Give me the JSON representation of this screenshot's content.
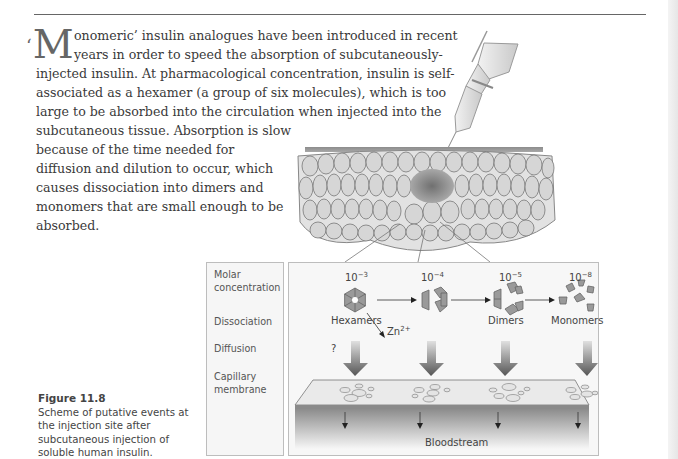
{
  "page": {
    "paragraph": {
      "dropcap_quote": "‘",
      "dropcap_letter": "M",
      "lines": [
        "onomeric’ insulin analogues have been introduced in recent",
        "years in order to speed the absorption of subcutaneously-",
        "injected insulin. At pharmacological concentration, insulin is self-",
        "associated as a hexamer (a group of six molecules), which is too",
        "large to be absorbed into the circulation when injected into the",
        "subcutaneous tissue. Absorption is slow",
        "because of the time needed for",
        "diffusion and dilution to occur, which",
        "causes dissociation into dimers and",
        "monomers that are small enough to be",
        "absorbed."
      ]
    },
    "figure": {
      "number": "Figure 11.8",
      "caption": "Scheme of putative events at the injection site after subcutaneous injection of soluble human insulin.",
      "caption_lines": [
        "Scheme of putative events at",
        "the injection site after",
        "subcutaneous injection of",
        "soluble human insulin."
      ],
      "row_labels": {
        "molar_1": "Molar",
        "molar_2": "concentration",
        "dissociation": "Dissociation",
        "diffusion": "Diffusion",
        "capillary_1": "Capillary",
        "capillary_2": "membrane"
      },
      "stages": [
        {
          "base": "10",
          "exp": "−3",
          "label": "Hexamers"
        },
        {
          "base": "10",
          "exp": "−4",
          "label": ""
        },
        {
          "base": "10",
          "exp": "−5",
          "label": "Dimers"
        },
        {
          "base": "10",
          "exp": "−8",
          "label": "Monomers"
        }
      ],
      "zinc_label": "Zn",
      "zinc_charge": "2+",
      "question_mark": "?",
      "bloodstream_label": "Bloodstream",
      "colors": {
        "molecule_fill": "#9a9a9a",
        "arrow_dark": "#555555",
        "skin_top": "#8a8a8a",
        "cell_fill": "#d8d8d8"
      }
    }
  }
}
